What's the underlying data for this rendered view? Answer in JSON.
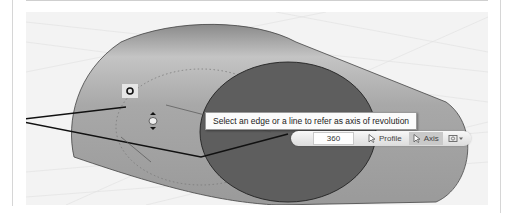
{
  "tooltip": {
    "text": "Select an edge or a line to refer as axis of revolution"
  },
  "toolbar": {
    "angle_value": "360",
    "profile_label": "Profile",
    "axis_label": "Axis",
    "axis_active": true,
    "options_icon": "view-options-dropdown-icon"
  },
  "viewport": {
    "background": "#f3f3f3",
    "cylinder_body_color": "#9e9e9e",
    "cylinder_end_color": "#5c5c5c",
    "grid_color": "#e2e2e2"
  }
}
